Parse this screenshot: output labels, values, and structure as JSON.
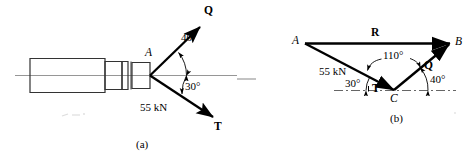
{
  "figure": {
    "type": "force-vector-diagram",
    "stroke_color": "#000000",
    "centerline_color": "#808080",
    "captions": {
      "a": "(a)",
      "b": "(b)"
    }
  },
  "diagram_a": {
    "name": "space-diagram",
    "point_labels": {
      "A": "A"
    },
    "vectors": [
      {
        "label": "Q",
        "name": "vector-q",
        "direction": "up-right"
      },
      {
        "label": "T",
        "name": "vector-t",
        "direction": "down-right"
      }
    ],
    "magnitudes": [
      {
        "label": "55 kN",
        "name": "force-magnitude-55kn"
      }
    ],
    "angles": [
      {
        "label": "40°",
        "name": "angle-40-deg"
      },
      {
        "label": "30°",
        "name": "angle-30-deg"
      }
    ]
  },
  "diagram_b": {
    "name": "force-triangle-diagram",
    "point_labels": {
      "A": "A",
      "B": "B",
      "C": "C"
    },
    "vectors": [
      {
        "label": "R",
        "name": "vector-r",
        "direction": "right"
      },
      {
        "label": "Q",
        "name": "vector-q",
        "direction": "up-right"
      },
      {
        "label": "T",
        "name": "vector-t",
        "direction": "down-right"
      }
    ],
    "magnitudes": [
      {
        "label": "55 kN",
        "name": "force-magnitude-55kn"
      }
    ],
    "angles": [
      {
        "label": "110°",
        "name": "angle-110-deg"
      },
      {
        "label": "30°",
        "name": "angle-30-deg"
      },
      {
        "label": "40°",
        "name": "angle-40-deg"
      }
    ]
  }
}
